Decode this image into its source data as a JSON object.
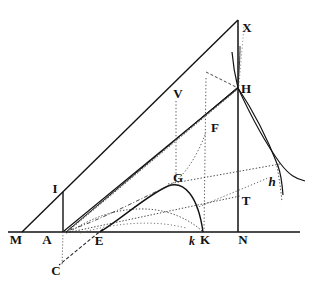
{
  "figure": {
    "background_color": "#ffffff",
    "ink_color": "#111111",
    "canvas": {
      "width": 315,
      "height": 293
    },
    "labels": [
      {
        "id": "M",
        "text": "M",
        "x": 16,
        "y": 240,
        "style": "roman"
      },
      {
        "id": "A",
        "text": "A",
        "x": 47,
        "y": 240,
        "style": "roman"
      },
      {
        "id": "E",
        "text": "E",
        "x": 99,
        "y": 241,
        "style": "roman"
      },
      {
        "id": "k",
        "text": "k",
        "x": 192,
        "y": 241,
        "style": "italic"
      },
      {
        "id": "K",
        "text": "K",
        "x": 205,
        "y": 240,
        "style": "roman"
      },
      {
        "id": "N",
        "text": "N",
        "x": 243,
        "y": 240,
        "style": "roman"
      },
      {
        "id": "C",
        "text": "C",
        "x": 56,
        "y": 271,
        "style": "roman"
      },
      {
        "id": "I",
        "text": "I",
        "x": 55,
        "y": 190,
        "style": "roman"
      },
      {
        "id": "G",
        "text": "G",
        "x": 177,
        "y": 179,
        "style": "roman"
      },
      {
        "id": "V",
        "text": "V",
        "x": 178,
        "y": 95,
        "style": "roman"
      },
      {
        "id": "F",
        "text": "F",
        "x": 214,
        "y": 129,
        "style": "roman"
      },
      {
        "id": "X",
        "text": "X",
        "x": 246,
        "y": 29,
        "style": "roman"
      },
      {
        "id": "H",
        "text": "H",
        "x": 245,
        "y": 90,
        "style": "roman"
      },
      {
        "id": "T",
        "text": "T",
        "x": 245,
        "y": 201,
        "style": "roman"
      },
      {
        "id": "h",
        "text": "h",
        "x": 272,
        "y": 182,
        "style": "italic"
      }
    ],
    "points": {
      "M": {
        "x": 22,
        "y": 232
      },
      "A": {
        "x": 63,
        "y": 232
      },
      "E": {
        "x": 100,
        "y": 232
      },
      "k": {
        "x": 195,
        "y": 232
      },
      "K": {
        "x": 206,
        "y": 232
      },
      "N": {
        "x": 238,
        "y": 232
      },
      "C": {
        "x": 58,
        "y": 262
      },
      "I": {
        "x": 63,
        "y": 195
      },
      "G": {
        "x": 170,
        "y": 186
      },
      "V": {
        "x": 176,
        "y": 106
      },
      "F": {
        "x": 206,
        "y": 131
      },
      "X": {
        "x": 238,
        "y": 20
      },
      "H": {
        "x": 238,
        "y": 88
      },
      "T": {
        "x": 238,
        "y": 197
      },
      "h": {
        "x": 278,
        "y": 166
      },
      "baseline_left": {
        "x": 8,
        "y": 232
      },
      "baseline_right": {
        "x": 300,
        "y": 232
      }
    },
    "segments": [
      {
        "name": "baseline-M-N-axis",
        "from": "baseline_left",
        "to": "baseline_right",
        "dash": "solid",
        "weight": 1.6
      },
      {
        "name": "hypotenuse-M-X",
        "from": "M",
        "to": "X",
        "dash": "solid",
        "weight": 1.4
      },
      {
        "name": "vertical-X-N",
        "from": "X",
        "to": "N",
        "dash": "solid",
        "weight": 1.4
      },
      {
        "name": "vertical-A-I",
        "from": "A",
        "to": "I",
        "dash": "solid",
        "weight": 1.3
      },
      {
        "name": "ray-A-H",
        "from": "A",
        "to": "H",
        "dash": "solid",
        "weight": 1.2
      },
      {
        "name": "ray-A-F-H",
        "from": "A",
        "to": "F",
        "dash": "solid",
        "weight": 1.1
      },
      {
        "name": "line-E-C",
        "from": "E",
        "to": "C",
        "dash": "dashed",
        "weight": 1.1
      },
      {
        "name": "ray-E-H",
        "from": "E",
        "to": "H",
        "dash": "dotted",
        "weight": 1.0
      },
      {
        "name": "ray-E-G-T",
        "from": "E",
        "to": "T",
        "dash": "dotted",
        "weight": 1.0
      },
      {
        "name": "vertical-V-drop",
        "from": "V",
        "to": "G",
        "dash": "dotted",
        "weight": 1.0
      },
      {
        "name": "vertical-F-k",
        "from": "F",
        "to": "k",
        "dash": "dotted",
        "weight": 1.0
      },
      {
        "name": "chord-G-h",
        "from": "G",
        "to": "h",
        "dash": "dotted",
        "weight": 1.0
      },
      {
        "name": "vertical-A-C-dotted",
        "from": "A",
        "to": "C",
        "dash": "dotted",
        "weight": 0.9
      }
    ],
    "curves": [
      {
        "name": "curve-hump-E-G-K",
        "dash": "solid",
        "weight": 1.3
      },
      {
        "name": "curve-low-A-E-K",
        "dash": "dotted",
        "weight": 1.0
      },
      {
        "name": "curve-upper-A-G",
        "dash": "dashdot",
        "weight": 1.0
      },
      {
        "name": "curve-X-H-descend",
        "dash": "solid",
        "weight": 1.2
      },
      {
        "name": "curve-H-h-outer",
        "dash": "solid",
        "weight": 1.2
      },
      {
        "name": "curve-H-h-inner",
        "dash": "dashdot",
        "weight": 1.0
      },
      {
        "name": "curve-asymptote-h",
        "dash": "dotted",
        "weight": 1.0
      }
    ]
  }
}
